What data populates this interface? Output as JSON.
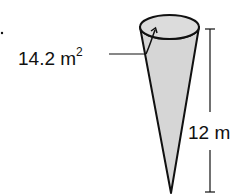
{
  "diagram": {
    "type": "cone",
    "area_label": "14.2 m",
    "area_exponent": "2",
    "height_label": "12 m",
    "colors": {
      "fill": "#d6d6d6",
      "stroke": "#111111",
      "background": "#ffffff"
    }
  }
}
